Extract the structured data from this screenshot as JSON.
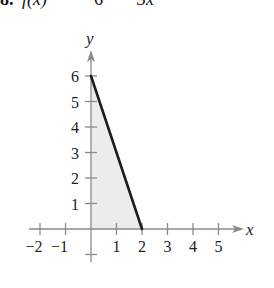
{
  "header": {
    "number": "8.",
    "lhs": "f(x)",
    "rhs_const": "6",
    "rhs_term": "3x"
  },
  "chart_data": {
    "type": "area",
    "xlabel": "x",
    "ylabel": "y",
    "xlim": [
      -2,
      5
    ],
    "ylim": [
      -1,
      6
    ],
    "x_ticks": [
      -2,
      -1,
      1,
      2,
      3,
      4,
      5
    ],
    "y_ticks": [
      1,
      2,
      3,
      4,
      5,
      6
    ],
    "series": [
      {
        "name": "f(x) = 6 − 3x",
        "x": [
          0,
          2
        ],
        "y": [
          6,
          0
        ],
        "shaded_region": "area under line from x=0 to x=2"
      }
    ],
    "grid": false,
    "legend": null
  },
  "axis": {
    "x_label": "x",
    "y_label": "y",
    "x_tick_labels": [
      "−2",
      "−1",
      "1",
      "2",
      "3",
      "4",
      "5"
    ],
    "y_tick_labels": [
      "1",
      "2",
      "3",
      "4",
      "5",
      "6"
    ]
  },
  "colors": {
    "line": "#1e1e1e",
    "shade": "#ececec",
    "axis": "#8a8a8a",
    "text": "#222222"
  }
}
